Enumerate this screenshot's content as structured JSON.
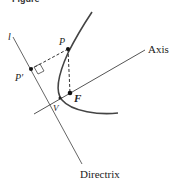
{
  "figure": {
    "caption": "Figure",
    "labels": {
      "line_l": "l",
      "point_p": "P",
      "point_p_prime": "P′",
      "point_f": "F",
      "point_v": "V",
      "axis": "Axis",
      "directrix": "Directrix"
    },
    "colors": {
      "line": "#555555",
      "curve": "#444444",
      "point": "#111111"
    }
  }
}
